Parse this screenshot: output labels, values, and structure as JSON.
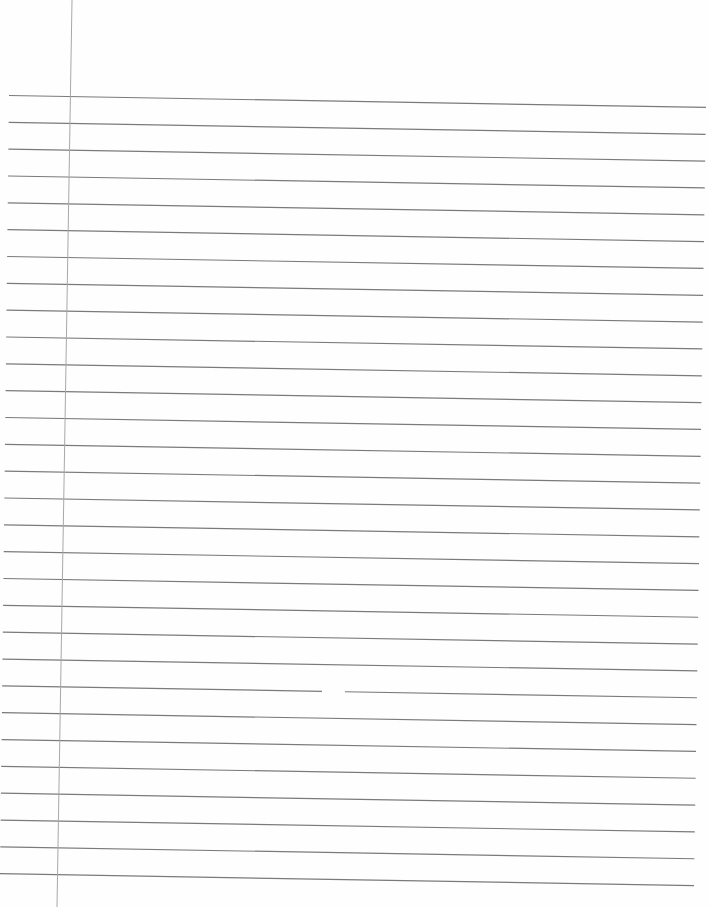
{
  "page": {
    "title": "Lined notebook paper",
    "background": "#fefefe"
  },
  "ruling": {
    "line_count": 30,
    "line_color": "#7a7a7a",
    "first_line_y_left": 95.5,
    "spacing": 26.84,
    "tilt_px_over_width": 12,
    "left_end_top_x": 9,
    "left_end_bottom_x": 0,
    "right_end_top_x": 706,
    "right_end_bottom_x": 694
  },
  "margin": {
    "color": "#a8a8a8",
    "x_top": 72,
    "x_bottom": 57
  },
  "artifact": {
    "gap_line_index": 22,
    "gap_x_start": 322,
    "gap_x_end": 345
  }
}
